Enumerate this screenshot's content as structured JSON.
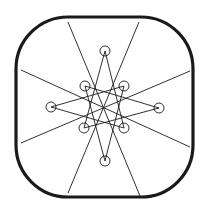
{
  "diagram": {
    "title": "",
    "colors": {
      "stroke": "#1a1a1a",
      "background": "#ffffff"
    },
    "frame": {
      "x": 16,
      "y": 17,
      "width": 177,
      "height": 180,
      "rx": 52,
      "stroke_width": 3.2
    },
    "spokes": [
      {
        "x1": 68,
        "y1": 22,
        "x2": 140,
        "y2": 196
      },
      {
        "x1": 139,
        "y1": 22,
        "x2": 68,
        "y2": 193
      },
      {
        "x1": 21,
        "y1": 70,
        "x2": 190,
        "y2": 147
      },
      {
        "x1": 21,
        "y1": 143,
        "x2": 190,
        "y2": 71
      }
    ],
    "nodes": [
      {
        "id": "top",
        "cx": 105,
        "cy": 51
      },
      {
        "id": "upper-left",
        "cx": 85,
        "cy": 86
      },
      {
        "id": "upper-right",
        "cx": 124,
        "cy": 86
      },
      {
        "id": "left",
        "cx": 51,
        "cy": 107
      },
      {
        "id": "right",
        "cx": 159,
        "cy": 108
      },
      {
        "id": "lower-left",
        "cx": 84,
        "cy": 128
      },
      {
        "id": "lower-right",
        "cx": 124,
        "cy": 128
      },
      {
        "id": "bottom",
        "cx": 105,
        "cy": 161
      }
    ],
    "node_radius": 5,
    "star_edges": [
      [
        "top",
        "lower-left"
      ],
      [
        "top",
        "lower-right"
      ],
      [
        "bottom",
        "upper-left"
      ],
      [
        "bottom",
        "upper-right"
      ],
      [
        "left",
        "upper-right"
      ],
      [
        "left",
        "lower-right"
      ],
      [
        "right",
        "upper-left"
      ],
      [
        "right",
        "lower-left"
      ]
    ]
  }
}
